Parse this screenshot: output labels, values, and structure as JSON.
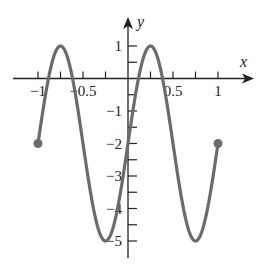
{
  "chart_data": {
    "type": "line",
    "title": "",
    "xlabel": "x",
    "ylabel": "y",
    "xlim": [
      -1.15,
      1.39
    ],
    "ylim": [
      -5.5,
      1.85
    ],
    "grid": false,
    "legend": null,
    "function_hint": "y = 3 sin(2πx) − 2",
    "x_ticks": [
      -1,
      -0.75,
      -0.5,
      -0.25,
      0.25,
      0.5,
      0.75,
      1
    ],
    "x_tick_labels": [
      {
        "value": -1,
        "label": "−1"
      },
      {
        "value": -0.5,
        "label": "−0.5"
      },
      {
        "value": 0.5,
        "label": "0.5"
      },
      {
        "value": 1,
        "label": "1"
      }
    ],
    "y_ticks": [
      1,
      0.5,
      -0.5,
      -1,
      -1.5,
      -2,
      -2.5,
      -3,
      -3.5,
      -4,
      -4.5,
      -5
    ],
    "y_tick_labels": [
      {
        "value": 1,
        "label": "1"
      },
      {
        "value": -1,
        "label": "−1"
      },
      {
        "value": -2,
        "label": "−2"
      },
      {
        "value": -3,
        "label": "−3"
      },
      {
        "value": -4,
        "label": "−4"
      },
      {
        "value": -5,
        "label": "−5"
      }
    ],
    "series": [
      {
        "name": "curve",
        "color": "#6b6b6b",
        "x": [
          -1,
          -0.875,
          -0.75,
          -0.625,
          -0.5,
          -0.375,
          -0.25,
          -0.125,
          0,
          0.125,
          0.25,
          0.375,
          0.5,
          0.625,
          0.75,
          0.875,
          1
        ],
        "y": [
          -2,
          0.12,
          1,
          0.12,
          -2,
          -4.12,
          -5,
          -4.12,
          -2,
          0.12,
          1,
          0.12,
          -2,
          -4.12,
          -5,
          -4.12,
          -2
        ]
      }
    ],
    "endpoints": [
      {
        "x": -1,
        "y": -2,
        "style": "closed-dot"
      },
      {
        "x": 1,
        "y": -2,
        "style": "closed-dot"
      }
    ],
    "key_points": {
      "maxima": [
        {
          "x": -0.75,
          "y": 1
        },
        {
          "x": 0.25,
          "y": 1
        }
      ],
      "minima": [
        {
          "x": -0.25,
          "y": -5
        },
        {
          "x": 0.75,
          "y": -5
        }
      ]
    }
  },
  "axes": {
    "x_name": "x",
    "y_name": "y"
  }
}
